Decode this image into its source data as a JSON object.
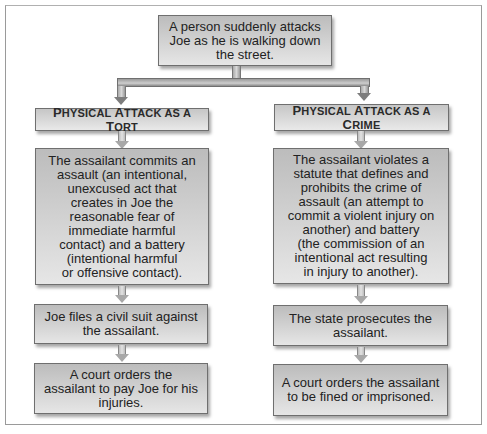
{
  "diagram": {
    "root": {
      "text": "A person suddenly attacks Joe as he is walking down the street.",
      "lines": [
        "A person suddenly attacks",
        "Joe as he is walking down",
        "the street."
      ]
    },
    "branches": [
      {
        "header": {
          "text": "Physical Attack as a Tort",
          "parts": [
            "P",
            "HYSICAL ",
            "A",
            "TTACK AS A ",
            "T",
            "ORT"
          ]
        },
        "steps": [
          {
            "lines": [
              "The assailant commits an",
              "assault (an intentional,",
              "unexcused act that",
              "creates in Joe the",
              "reasonable fear of",
              "immediate harmful",
              "contact) and a battery",
              "(intentional harmful",
              "or offensive contact)."
            ]
          },
          {
            "lines": [
              "Joe files a civil suit against",
              "the assailant."
            ]
          },
          {
            "lines": [
              "A court orders the",
              "assailant to pay Joe for his",
              "injuries."
            ]
          }
        ]
      },
      {
        "header": {
          "text": "Physical Attack as a Crime",
          "parts": [
            "P",
            "HYSICAL ",
            "A",
            "TTACK AS A ",
            "C",
            "RIME"
          ]
        },
        "steps": [
          {
            "lines": [
              "The assailant violates a",
              "statute that defines and",
              "prohibits the crime of",
              "assault (an attempt to",
              "commit a violent injury on",
              "another) and battery",
              "(the commission of an",
              "intentional act resulting",
              "in injury to another)."
            ]
          },
          {
            "lines": [
              "The state prosecutes the",
              "assailant."
            ]
          },
          {
            "lines": [
              "A court orders the assailant",
              "to be fined or imprisoned."
            ]
          }
        ]
      }
    ],
    "colors": {
      "box_top": "#bcbcbc",
      "box_bottom": "#e6e6e6",
      "border": "#6f6f6f",
      "text": "#222222"
    }
  }
}
